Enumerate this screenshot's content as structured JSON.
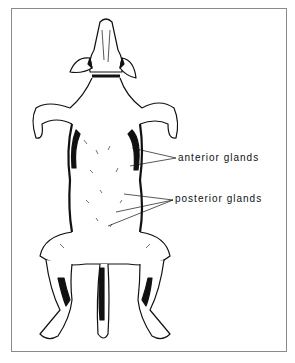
{
  "figure": {
    "labels": [
      {
        "id": "anterior",
        "text": "anterior glands"
      },
      {
        "id": "posterior",
        "text": "posterior glands"
      }
    ],
    "colors": {
      "ink": "#111111",
      "frame": "#8a8a8a",
      "background": "#ffffff"
    }
  }
}
